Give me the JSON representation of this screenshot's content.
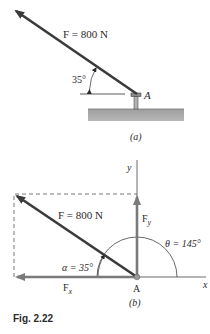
{
  "figure": {
    "caption": "Fig. 2.22",
    "part_a": {
      "force_label": "F = 800 N",
      "angle_label": "35°",
      "point_label": "A",
      "sublabel": "(a)"
    },
    "part_b": {
      "force_label": "F = 800 N",
      "alpha_label": "α = 35°",
      "theta_label": "θ = 145°",
      "fy_label": "F",
      "fy_sub": "y",
      "fx_label": "F",
      "fx_sub": "x",
      "point_label": "A",
      "x_axis_label": "x",
      "y_axis_label": "y",
      "sublabel": "(b)"
    },
    "colors": {
      "force": "#3a3a3a",
      "component": "#7a7a7a",
      "ground": "#a9a9a9",
      "axis": "#444444"
    }
  }
}
